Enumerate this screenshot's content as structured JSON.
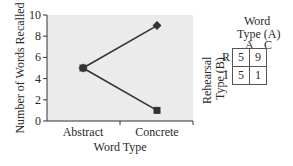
{
  "chart_data": {
    "type": "line",
    "title": "",
    "xlabel": "Word Type",
    "ylabel": "Number of Words Recalled",
    "categories": [
      "Abstract",
      "Concrete"
    ],
    "ylim": [
      0,
      10
    ],
    "yticks": [
      0,
      2,
      4,
      6,
      8,
      10
    ],
    "grid": false,
    "legend": "none",
    "series": [
      {
        "name": "Rehearsal Type R",
        "values": [
          5,
          9
        ],
        "marker": "diamond"
      },
      {
        "name": "Rehearsal Type I",
        "values": [
          5,
          1
        ],
        "marker": "square"
      }
    ]
  },
  "table": {
    "col_title_line1": "Word",
    "col_title_line2": "Type (A)",
    "row_title_line1": "Rehearsal",
    "row_title_line2": "Type (B)",
    "col_headers": [
      "A",
      "C"
    ],
    "row_headers": [
      "R",
      "I"
    ],
    "cells": [
      [
        5,
        9
      ],
      [
        5,
        1
      ]
    ]
  },
  "colors": {
    "plot_bg": "#ebebeb",
    "line": "#333333",
    "axis": "#333333"
  }
}
